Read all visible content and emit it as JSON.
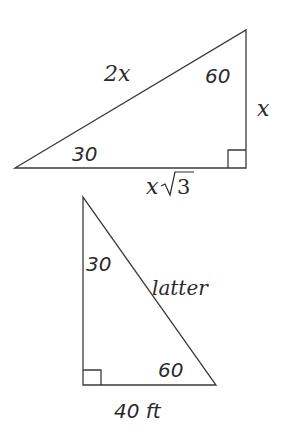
{
  "diagram": {
    "type": "right-triangles",
    "reference_triangle": {
      "hypotenuse_label": "2x",
      "short_leg_label": "x",
      "long_leg_label_prefix": "x",
      "long_leg_label_radical": "3",
      "angle_small": "30",
      "angle_large": "60",
      "right_angle": true
    },
    "problem_triangle": {
      "hypotenuse_label": "latter",
      "base_label": "40 ft",
      "angle_top": "30",
      "angle_bottom": "60",
      "right_angle": true
    }
  }
}
